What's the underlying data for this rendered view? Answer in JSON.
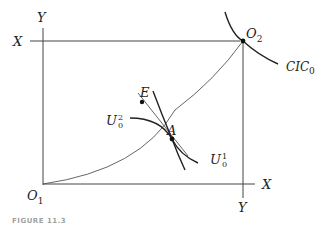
{
  "diagram": {
    "type": "edgeworth-box",
    "axes": {
      "left_axis_label": "Y",
      "top_axis_label": "X",
      "bottom_axis_label": "X",
      "right_axis_label": "Y"
    },
    "origins": {
      "o1": {
        "base": "O",
        "sub": "1"
      },
      "o2": {
        "base": "O",
        "sub": "2"
      }
    },
    "curves": {
      "cic": {
        "base": "CIC",
        "sub": "0"
      },
      "u_upper": {
        "base": "U",
        "sup": "2",
        "sub": "0"
      },
      "u_lower": {
        "base": "U",
        "sup": "1",
        "sub": "0"
      }
    },
    "points": {
      "a": "A",
      "e": "E"
    },
    "caption": "FIGURE 11.3"
  }
}
